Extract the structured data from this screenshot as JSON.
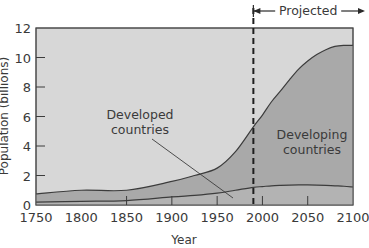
{
  "chart_data": {
    "type": "area",
    "title": "",
    "xlabel": "Year",
    "ylabel": "Population (billions)",
    "xlim": [
      1750,
      2100
    ],
    "ylim": [
      0,
      12
    ],
    "x_ticks": [
      1750,
      1800,
      1850,
      1900,
      1950,
      2000,
      2050,
      2100
    ],
    "y_ticks": [
      0,
      2,
      4,
      6,
      8,
      10,
      12
    ],
    "grid": false,
    "stacked": true,
    "x": [
      1750,
      1800,
      1850,
      1900,
      1925,
      1950,
      1970,
      1990,
      2000,
      2010,
      2020,
      2030,
      2040,
      2050,
      2060,
      2070,
      2080,
      2090,
      2100
    ],
    "series": [
      {
        "name": "Developed countries",
        "values": [
          0.2,
          0.25,
          0.3,
          0.55,
          0.65,
          0.8,
          1.0,
          1.2,
          1.25,
          1.3,
          1.33,
          1.35,
          1.36,
          1.36,
          1.35,
          1.33,
          1.3,
          1.27,
          1.22
        ],
        "color": "#d6d6d6"
      },
      {
        "name": "Developing countries",
        "values": [
          0.55,
          0.75,
          0.7,
          1.05,
          1.35,
          1.7,
          2.6,
          4.1,
          4.85,
          5.7,
          6.4,
          7.15,
          7.85,
          8.4,
          8.85,
          9.2,
          9.45,
          9.55,
          9.6
        ],
        "color": "#a8a8a8"
      }
    ],
    "total_values": [
      0.75,
      1.0,
      1.0,
      1.6,
      2.0,
      2.5,
      3.6,
      5.3,
      6.1,
      7.0,
      7.73,
      8.5,
      9.21,
      9.76,
      10.2,
      10.53,
      10.75,
      10.82,
      10.82
    ],
    "annotations": [
      {
        "text": "Projected",
        "type": "bracket-arrow",
        "from_year": 1990,
        "to_year": 2100
      },
      {
        "text": "Developed countries",
        "type": "leader-line-label",
        "points_to_year": 1965
      },
      {
        "text": "Developing countries",
        "type": "area-label"
      }
    ],
    "vertical_marker": {
      "year": 1990,
      "style": "dashed"
    },
    "legend_position": "none"
  },
  "labels": {
    "y_axis": "Population (billions)",
    "x_axis": "Year",
    "projected": "Projected",
    "developed_line1": "Developed",
    "developed_line2": "countries",
    "developing_line1": "Developing",
    "developing_line2": "countries"
  },
  "colors": {
    "background_plot": "#d9d9d9",
    "developing_fill": "#a9a9a9",
    "developed_fill": "#b9b9b9",
    "line": "#3c3c3c"
  }
}
